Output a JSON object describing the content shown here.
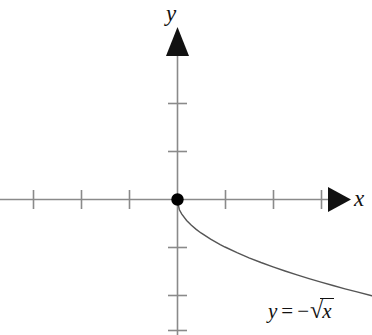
{
  "figure": {
    "kind": "cartesian-graph",
    "width": 372,
    "height": 335,
    "background_color": "#ffffff"
  },
  "labels": {
    "y_axis": "y",
    "x_axis": "x",
    "equation": {
      "lhs": "y",
      "operator": "=",
      "minus": "−",
      "radical_sign": "√",
      "radicand": "x",
      "full_text": "y = −√x"
    }
  },
  "style": {
    "axis_color": "#8a8a8a",
    "tick_color": "#8a8a8a",
    "curve_color": "#555555",
    "arrow_color": "#111111",
    "point_color": "#000000",
    "text_color": "#111111"
  },
  "chart_data": {
    "type": "line",
    "title": "",
    "xlabel": "x",
    "ylabel": "y",
    "function": "y = -sqrt(x)",
    "domain": [
      0,
      4.1
    ],
    "grid": false,
    "legend": "none",
    "annotations": [
      {
        "text": "y = −√x",
        "x_px": 268,
        "y_px": 298
      }
    ],
    "origin_point": {
      "x": 0,
      "y": 0,
      "marked": true,
      "style": "filled-dot"
    },
    "axes": {
      "origin_px": {
        "x": 177,
        "y": 199
      },
      "unit_px": 48,
      "x_axis_px": {
        "x1": 0,
        "x2": 332,
        "y": 199
      },
      "y_axis_px": {
        "x": 177,
        "y1": 50,
        "y2": 335
      },
      "x_ticks_units": [
        -3,
        -2,
        -1,
        1,
        2,
        3
      ],
      "y_ticks_units": [
        -3,
        -2,
        1,
        2
      ],
      "x_arrow": "right",
      "y_arrow": "up",
      "tick_half_length_px": 9
    },
    "points": [
      {
        "x": 0.0,
        "y": 0.0
      },
      {
        "x": 0.05,
        "y": -0.224
      },
      {
        "x": 0.1,
        "y": -0.316
      },
      {
        "x": 0.2,
        "y": -0.447
      },
      {
        "x": 0.3,
        "y": -0.548
      },
      {
        "x": 0.4,
        "y": -0.632
      },
      {
        "x": 0.5,
        "y": -0.707
      },
      {
        "x": 0.7,
        "y": -0.837
      },
      {
        "x": 0.9,
        "y": -0.949
      },
      {
        "x": 1.0,
        "y": -1.0
      },
      {
        "x": 1.25,
        "y": -1.118
      },
      {
        "x": 1.5,
        "y": -1.225
      },
      {
        "x": 1.75,
        "y": -1.323
      },
      {
        "x": 2.0,
        "y": -1.414
      },
      {
        "x": 2.25,
        "y": -1.5
      },
      {
        "x": 2.5,
        "y": -1.581
      },
      {
        "x": 2.75,
        "y": -1.658
      },
      {
        "x": 3.0,
        "y": -1.732
      },
      {
        "x": 3.25,
        "y": -1.803
      },
      {
        "x": 3.5,
        "y": -1.871
      },
      {
        "x": 3.75,
        "y": -1.936
      },
      {
        "x": 4.06,
        "y": -2.015
      }
    ]
  }
}
